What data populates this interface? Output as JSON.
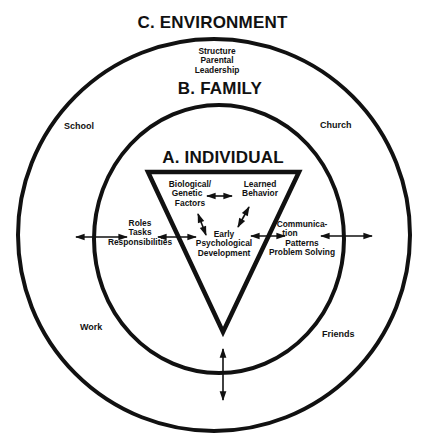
{
  "diagram": {
    "levels": {
      "environment": {
        "title": "C. ENVIRONMENT",
        "items": [
          "School",
          "Church",
          "Work",
          "Friends"
        ]
      },
      "family": {
        "title": "B. FAMILY",
        "top_lines": [
          "Structure",
          "Parental",
          "Leadership"
        ],
        "left_lines": [
          "Roles",
          "Tasks",
          "Responsibilities"
        ],
        "right_lines": [
          "Communica-",
          "tion",
          "Patterns",
          "Problem Solving"
        ]
      },
      "individual": {
        "title": "A. INDIVIDUAL",
        "biological_lines": [
          "Biological/",
          "Genetic",
          "Factors"
        ],
        "learned_lines": [
          "Learned",
          "Behavior"
        ],
        "center_lines": [
          "Early",
          "Psychological",
          "Development"
        ]
      }
    },
    "colors": {
      "stroke": "#111111",
      "background": "#ffffff"
    }
  }
}
